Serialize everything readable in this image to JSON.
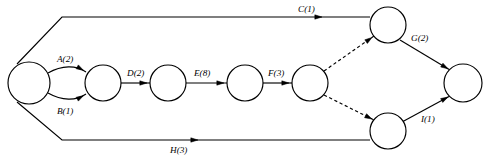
{
  "diagram": {
    "type": "activity-on-arrow-network",
    "title": "",
    "stroke_color": "#000000",
    "background_color": "#ffffff",
    "node_fill": "#ffffff"
  },
  "nodes": [
    {
      "id": "n1",
      "name": "start-node",
      "cx": 29,
      "cy": 83,
      "r": 21
    },
    {
      "id": "n2",
      "name": "node-2",
      "cx": 103,
      "cy": 83,
      "r": 18
    },
    {
      "id": "n3",
      "name": "node-3",
      "cx": 168,
      "cy": 83,
      "r": 18
    },
    {
      "id": "n4",
      "name": "node-4",
      "cx": 245,
      "cy": 83,
      "r": 18
    },
    {
      "id": "n5",
      "name": "node-5",
      "cx": 310,
      "cy": 83,
      "r": 18
    },
    {
      "id": "n6",
      "name": "upper-merge-node",
      "cx": 388,
      "cy": 25,
      "r": 18
    },
    {
      "id": "n7",
      "name": "lower-merge-node",
      "cx": 388,
      "cy": 131,
      "r": 18
    },
    {
      "id": "n8",
      "name": "end-node",
      "cx": 463,
      "cy": 83,
      "r": 19
    }
  ],
  "edges": [
    {
      "id": "e-a",
      "name": "edge-a",
      "label": "A(2)",
      "activity": "A",
      "duration": 2,
      "from": "n1",
      "to": "n2",
      "style": "solid-curve",
      "path": "M 48 73 C 62 65, 76 65, 86 72",
      "label_x": 57,
      "label_y": 62,
      "arrow": {
        "x": 83.5,
        "y": 70.4,
        "angle": 30
      }
    },
    {
      "id": "e-b",
      "name": "edge-b",
      "label": "B(1)",
      "activity": "B",
      "duration": 1,
      "from": "n1",
      "to": "n2",
      "style": "solid-curve",
      "path": "M 48 93 C 62 101, 76 101, 86 94",
      "label_x": 57,
      "label_y": 114,
      "arrow": {
        "x": 83.5,
        "y": 95.6,
        "angle": -30
      }
    },
    {
      "id": "e-c",
      "name": "edge-c",
      "label": "C(1)",
      "activity": "C",
      "duration": 1,
      "from": "n1",
      "to": "n6",
      "style": "solid-polyline",
      "path": "M 17 64 L 62 17 L 370 17",
      "label_x": 298,
      "label_y": 12,
      "arrow": {
        "x": 322,
        "y": 17,
        "angle": 0
      }
    },
    {
      "id": "e-d",
      "name": "edge-d",
      "label": "D(2)",
      "activity": "D",
      "duration": 2,
      "from": "n2",
      "to": "n3",
      "style": "solid-line",
      "path": "M 121 83 L 150 83",
      "label_x": 127,
      "label_y": 76,
      "arrow": {
        "x": 147,
        "y": 83,
        "angle": 0
      }
    },
    {
      "id": "e-e",
      "name": "edge-e",
      "label": "E(8)",
      "activity": "E",
      "duration": 8,
      "from": "n3",
      "to": "n4",
      "style": "solid-line",
      "path": "M 186 83 L 227 83",
      "label_x": 194,
      "label_y": 76,
      "arrow": {
        "x": 224,
        "y": 83,
        "angle": 0
      }
    },
    {
      "id": "e-f",
      "name": "edge-f",
      "label": "F(3)",
      "activity": "F",
      "duration": 3,
      "from": "n4",
      "to": "n5",
      "style": "solid-line",
      "path": "M 263 83 L 292 83",
      "label_x": 268,
      "label_y": 76,
      "arrow": {
        "x": 289,
        "y": 83,
        "angle": 0
      }
    },
    {
      "id": "e-dummy-upper",
      "name": "edge-dummy-upper",
      "label": "",
      "activity": "",
      "duration": 0,
      "from": "n5",
      "to": "n6",
      "style": "dashed-line",
      "path": "M 324 71 L 374 36",
      "arrow": {
        "x": 372,
        "y": 37.5,
        "angle": -35
      }
    },
    {
      "id": "e-dummy-lower",
      "name": "edge-dummy-lower",
      "label": "",
      "activity": "",
      "duration": 0,
      "from": "n5",
      "to": "n7",
      "style": "dashed-line",
      "path": "M 324 95 L 374 120",
      "arrow": {
        "x": 372,
        "y": 119,
        "angle": 27
      }
    },
    {
      "id": "e-g",
      "name": "edge-g",
      "label": "G(2)",
      "activity": "G",
      "duration": 2,
      "from": "n6",
      "to": "n8",
      "style": "solid-line",
      "path": "M 400 40 L 450 70",
      "label_x": 411,
      "label_y": 41,
      "arrow": {
        "x": 448,
        "y": 68.8,
        "angle": 31
      }
    },
    {
      "id": "e-h",
      "name": "edge-h",
      "label": "H(3)",
      "activity": "H",
      "duration": 3,
      "from": "n1",
      "to": "n7",
      "style": "solid-polyline",
      "path": "M 17 102 L 62 140 L 370 140",
      "label_x": 170,
      "label_y": 153,
      "arrow": {
        "x": 198,
        "y": 140,
        "angle": 0
      }
    },
    {
      "id": "e-i",
      "name": "edge-i",
      "label": "I(1)",
      "activity": "I",
      "duration": 1,
      "from": "n7",
      "to": "n8",
      "style": "solid-line",
      "path": "M 402 122 L 450 96",
      "label_x": 421,
      "label_y": 122,
      "arrow": {
        "x": 448,
        "y": 97,
        "angle": -29
      }
    }
  ]
}
